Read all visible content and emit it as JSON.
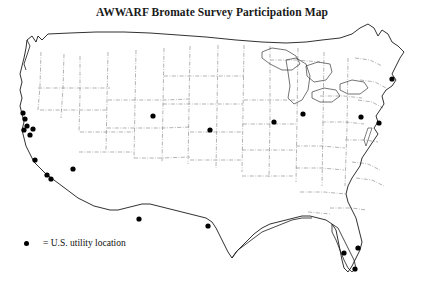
{
  "figure": {
    "title": "AWWARF Bromate Survey Participation Map",
    "background_color": "#ffffff",
    "outline_color": "#1a1a1a",
    "internal_border_color": "#555555",
    "marker_color": "#000000",
    "width": 424,
    "height": 288
  },
  "legend": {
    "marker_symbol": "filled-circle",
    "marker_icon_name": "utility-location-dot-icon",
    "label": "= U.S. utility location",
    "position": "bottom-left"
  },
  "chart_data": {
    "type": "scatter",
    "title": "AWWARF Bromate Survey Participation Map",
    "xlabel": "",
    "ylabel": "",
    "projection": "contiguous-united-states",
    "grid": false,
    "legend_position": "bottom-left",
    "series": [
      {
        "name": "= U.S. utility location",
        "marker": "filled-circle",
        "color": "#000000",
        "count": 20,
        "points": [
          {
            "label": "Northern California coast 1",
            "x": 23,
            "y": 113
          },
          {
            "label": "Northern California coast 2",
            "x": 25,
            "y": 119
          },
          {
            "label": "Northern California coast 3",
            "x": 27,
            "y": 126
          },
          {
            "label": "San Francisco Bay Area 1",
            "x": 24,
            "y": 130
          },
          {
            "label": "San Francisco Bay Area 2",
            "x": 33,
            "y": 129
          },
          {
            "label": "San Francisco Bay Area 3",
            "x": 30,
            "y": 135
          },
          {
            "label": "Central California",
            "x": 35,
            "y": 160
          },
          {
            "label": "Southern California 1",
            "x": 47,
            "y": 175
          },
          {
            "label": "Southern California 2",
            "x": 51,
            "y": 179
          },
          {
            "label": "Arizona / Colorado River",
            "x": 73,
            "y": 169
          },
          {
            "label": "Colorado",
            "x": 153,
            "y": 116
          },
          {
            "label": "Nebraska",
            "x": 210,
            "y": 130
          },
          {
            "label": "Illinois",
            "x": 274,
            "y": 122
          },
          {
            "label": "Indiana / Michigan",
            "x": 303,
            "y": 114
          },
          {
            "label": "Pennsylvania",
            "x": 361,
            "y": 117
          },
          {
            "label": "New Jersey / New York",
            "x": 379,
            "y": 123
          },
          {
            "label": "Massachusetts",
            "x": 392,
            "y": 79
          },
          {
            "label": "West Texas / New Mexico",
            "x": 139,
            "y": 219
          },
          {
            "label": "Central Texas",
            "x": 208,
            "y": 226
          },
          {
            "label": "Florida west",
            "x": 344,
            "y": 253
          },
          {
            "label": "Florida central",
            "x": 358,
            "y": 248
          },
          {
            "label": "Florida south",
            "x": 355,
            "y": 269
          }
        ]
      }
    ]
  }
}
